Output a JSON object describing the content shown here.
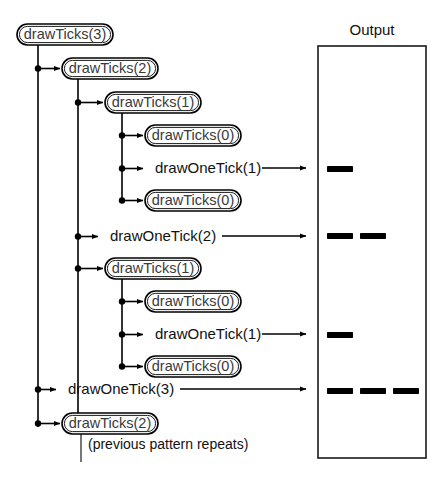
{
  "diagram": {
    "title_hidden": "",
    "type": "recursion-call-trace",
    "colors": {
      "stroke": "#000000",
      "node_text": "#3a3a3a",
      "plain_text": "#111111",
      "panel_border": "#1a1a1a",
      "background": "#ffffff"
    },
    "root": {
      "label": "drawTicks(3)",
      "x": 17,
      "y": 24,
      "w": 96,
      "h": 21,
      "spine_x": 38,
      "spine_y1": 45,
      "spine_y2": 427
    },
    "nodes": [
      {
        "id": "n0",
        "kind": "call",
        "label": "drawTicks(3)",
        "x": 17,
        "y": 24,
        "w": 96,
        "h": 21,
        "dot_x": null,
        "depth": 0
      },
      {
        "id": "n1",
        "kind": "call",
        "label": "drawTicks(2)",
        "x": 62,
        "y": 58,
        "w": 96,
        "h": 21,
        "dot_x": 38,
        "depth": 1
      },
      {
        "id": "n2",
        "kind": "call",
        "label": "drawTicks(1)",
        "x": 105,
        "y": 92,
        "w": 96,
        "h": 21,
        "dot_x": 78,
        "depth": 2
      },
      {
        "id": "n3",
        "kind": "call",
        "label": "drawTicks(0)",
        "x": 145,
        "y": 125,
        "w": 96,
        "h": 21,
        "dot_x": 122,
        "depth": 3
      },
      {
        "id": "n4",
        "kind": "emit",
        "label": "drawOneTick(1)",
        "x": 155,
        "y": 158,
        "w": 0,
        "h": 21,
        "dot_x": 122,
        "depth": 3
      },
      {
        "id": "n5",
        "kind": "call",
        "label": "drawTicks(0)",
        "x": 145,
        "y": 190,
        "w": 96,
        "h": 21,
        "dot_x": 122,
        "depth": 3
      },
      {
        "id": "n6",
        "kind": "emit",
        "label": "drawOneTick(2)",
        "x": 110,
        "y": 226,
        "w": 0,
        "h": 21,
        "dot_x": 78,
        "depth": 2
      },
      {
        "id": "n7",
        "kind": "call",
        "label": "drawTicks(1)",
        "x": 105,
        "y": 258,
        "w": 96,
        "h": 21,
        "dot_x": 78,
        "depth": 2
      },
      {
        "id": "n8",
        "kind": "call",
        "label": "drawTicks(0)",
        "x": 145,
        "y": 291,
        "w": 96,
        "h": 21,
        "dot_x": 122,
        "depth": 3
      },
      {
        "id": "n9",
        "kind": "emit",
        "label": "drawOneTick(1)",
        "x": 155,
        "y": 324,
        "w": 0,
        "h": 21,
        "dot_x": 122,
        "depth": 3
      },
      {
        "id": "n10",
        "kind": "call",
        "label": "drawTicks(0)",
        "x": 145,
        "y": 356,
        "w": 96,
        "h": 21,
        "dot_x": 122,
        "depth": 3
      },
      {
        "id": "n11",
        "kind": "emit",
        "label": "drawOneTick(3)",
        "x": 68,
        "y": 379,
        "w": 0,
        "h": 21,
        "dot_x": 38,
        "depth": 1
      },
      {
        "id": "n12",
        "kind": "call",
        "label": "drawTicks(2)",
        "x": 62,
        "y": 413,
        "w": 96,
        "h": 21,
        "dot_x": 38,
        "depth": 1
      }
    ],
    "sub_spines": [
      {
        "parent": "n1",
        "x": 78,
        "y1": 79,
        "y2": 423
      },
      {
        "parent": "n2",
        "x": 122,
        "y1": 113,
        "y2": 200
      },
      {
        "parent": "n7",
        "x": 122,
        "y1": 279,
        "y2": 366
      },
      {
        "parent": "n12",
        "x": 81,
        "y1": 434,
        "y2": 462
      }
    ],
    "note": {
      "label": "(previous pattern repeats)",
      "x": 88,
      "y": 445
    },
    "emit_arrows": [
      {
        "from_id": "n4",
        "x1": 262,
        "x2": 306,
        "y": 168
      },
      {
        "from_id": "n6",
        "x1": 222,
        "x2": 306,
        "y": 236
      },
      {
        "from_id": "n9",
        "x1": 262,
        "x2": 306,
        "y": 334
      },
      {
        "from_id": "n11",
        "x1": 180,
        "x2": 306,
        "y": 389
      }
    ]
  },
  "output_panel": {
    "title": "Output",
    "title_x": 372,
    "title_y": 31,
    "rect": {
      "x": 318,
      "y": 46,
      "w": 108,
      "h": 412
    },
    "rows": [
      {
        "from": "drawOneTick(1)",
        "y": 166,
        "ticks": [
          {
            "x": 327,
            "w": 26
          }
        ]
      },
      {
        "from": "drawOneTick(2)",
        "y": 233,
        "ticks": [
          {
            "x": 327,
            "w": 26
          },
          {
            "x": 360,
            "w": 26
          }
        ]
      },
      {
        "from": "drawOneTick(1)",
        "y": 332,
        "ticks": [
          {
            "x": 327,
            "w": 26
          }
        ]
      },
      {
        "from": "drawOneTick(3)",
        "y": 388,
        "ticks": [
          {
            "x": 327,
            "w": 26
          },
          {
            "x": 360,
            "w": 26
          },
          {
            "x": 393,
            "w": 26
          }
        ]
      }
    ],
    "tick_height": 6
  }
}
